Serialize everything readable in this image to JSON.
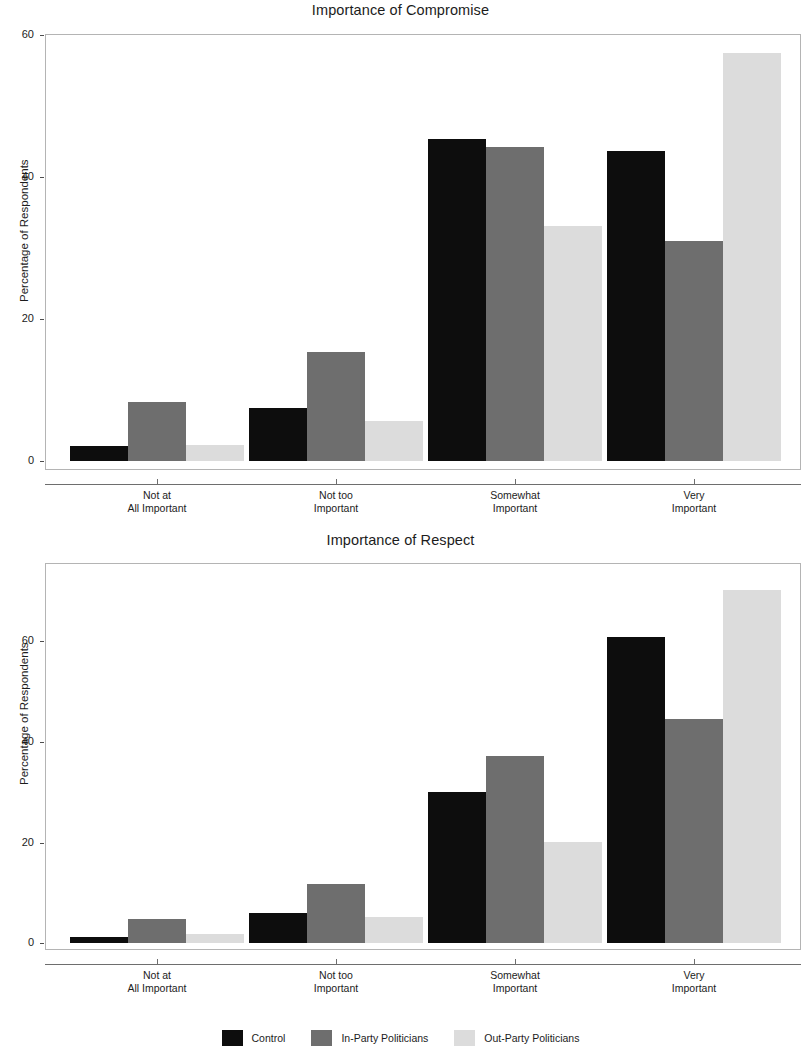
{
  "figure": {
    "width": 801,
    "height": 1057,
    "background": "#ffffff"
  },
  "legend": {
    "position": "bottom-center",
    "entries": [
      {
        "label": "Control",
        "color": "#0d0d0d"
      },
      {
        "label": "In-Party Politicians",
        "color": "#6e6e6e"
      },
      {
        "label": "Out-Party Politicians",
        "color": "#dcdcdc"
      }
    ]
  },
  "chart_data": [
    {
      "type": "bar",
      "title": "Importance of Compromise",
      "xlabel": "",
      "ylabel": "Percentage of Respondents",
      "categories": [
        "Not at\nAll Important",
        "Not too\nImportant",
        "Somewhat\nImportant",
        "Very\nImportant"
      ],
      "category_lines": [
        [
          "Not at",
          "All Important"
        ],
        [
          "Not too",
          "Important"
        ],
        [
          "Somewhat",
          "Important"
        ],
        [
          "Very",
          "Important"
        ]
      ],
      "series": [
        {
          "name": "Control",
          "color": "#0d0d0d",
          "values": [
            2.1,
            7.5,
            45.3,
            43.6
          ]
        },
        {
          "name": "In-Party Politicians",
          "color": "#6e6e6e",
          "values": [
            8.3,
            15.4,
            44.2,
            31.0
          ]
        },
        {
          "name": "Out-Party Politicians",
          "color": "#dcdcdc",
          "values": [
            2.3,
            5.6,
            33.1,
            57.5
          ]
        }
      ],
      "yticks": [
        0,
        20,
        40,
        60
      ],
      "ytick_labels": [
        "0",
        "20",
        "40",
        "60"
      ],
      "ylim": [
        0,
        60.5
      ],
      "grid": false,
      "legend_position": "bottom"
    },
    {
      "type": "bar",
      "title": "Importance of Respect",
      "xlabel": "",
      "ylabel": "Percentage of Respondents",
      "categories": [
        "Not at\nAll Important",
        "Not too\nImportant",
        "Somewhat\nImportant",
        "Very\nImportant"
      ],
      "category_lines": [
        [
          "Not at",
          "All Important"
        ],
        [
          "Not too",
          "Important"
        ],
        [
          "Somewhat",
          "Important"
        ],
        [
          "Very",
          "Important"
        ]
      ],
      "series": [
        {
          "name": "Control",
          "color": "#0d0d0d",
          "values": [
            1.2,
            6.1,
            30.0,
            60.7
          ]
        },
        {
          "name": "In-Party Politicians",
          "color": "#6e6e6e",
          "values": [
            4.9,
            11.8,
            37.1,
            44.5
          ]
        },
        {
          "name": "Out-Party Politicians",
          "color": "#dcdcdc",
          "values": [
            1.8,
            5.3,
            20.1,
            70.2
          ]
        }
      ],
      "yticks": [
        0,
        20,
        40,
        60
      ],
      "ytick_labels": [
        "0",
        "20",
        "40",
        "60"
      ],
      "ylim": [
        0,
        72.5
      ],
      "grid": false,
      "legend_position": "bottom"
    }
  ]
}
